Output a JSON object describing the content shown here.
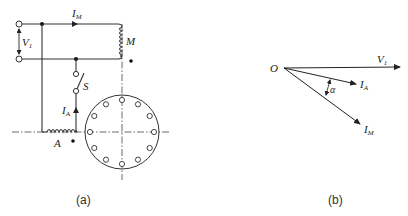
{
  "figure_a": {
    "caption": "(a)",
    "labels": {
      "current_main": "I",
      "current_main_sub": "M",
      "voltage": "V",
      "voltage_sub": "1",
      "coil_main": "M",
      "switch": "S",
      "current_aux": "I",
      "current_aux_sub": "A",
      "coil_aux": "A"
    },
    "stator_holes": 12
  },
  "figure_b": {
    "caption": "(b)",
    "labels": {
      "origin": "O",
      "v1": "V",
      "v1_sub": "1",
      "ia": "I",
      "ia_sub": "A",
      "im": "I",
      "im_sub": "M",
      "angle": "α"
    }
  }
}
